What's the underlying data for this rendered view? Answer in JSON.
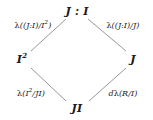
{
  "diagram": {
    "type": "hasse-diamond-lattice",
    "background_color": "#ffffff",
    "line_color": "#8c8c8c",
    "text_color": "#1a1a1a",
    "nodes": {
      "top": {
        "text": "J : I",
        "base": "J : I",
        "x": 77,
        "y": 11
      },
      "left": {
        "text": "I2",
        "base": "I",
        "exponent": "2",
        "x": 22,
        "y": 59
      },
      "right": {
        "text": "J",
        "base": "J",
        "x": 133,
        "y": 59
      },
      "bottom": {
        "text": "JI",
        "base": "JI",
        "x": 77,
        "y": 108
      }
    },
    "edge_labels": {
      "top_left": {
        "lambda": "λ",
        "argument": "((J:I)/I2)",
        "prefix": "((J:I)/I",
        "exponent": "2",
        "suffix": ")",
        "x": 33,
        "y": 25
      },
      "top_right": {
        "lambda": "λ",
        "argument": "((J:I)/J)",
        "prefix": "((J:I)/J)",
        "exponent": "",
        "suffix": "",
        "x": 123,
        "y": 25
      },
      "bottom_left": {
        "lambda": "λ",
        "argument": "(I2/JI)",
        "prefix": "(I",
        "exponent": "2",
        "suffix": "/JI)",
        "x": 31,
        "y": 93
      },
      "bottom_right": {
        "d_prefix": "d",
        "lambda": "λ",
        "argument": "(R/I)",
        "prefix": "(R/I)",
        "exponent": "",
        "suffix": "",
        "x": 123,
        "y": 93
      }
    },
    "edges": [
      {
        "from": "left",
        "to": "top",
        "x1": 31,
        "y1": 51,
        "x2": 66,
        "y2": 19
      },
      {
        "from": "top",
        "to": "right",
        "x1": 88,
        "y1": 19,
        "x2": 126,
        "y2": 51
      },
      {
        "from": "bottom",
        "to": "left",
        "x1": 66,
        "y1": 101,
        "x2": 31,
        "y2": 68
      },
      {
        "from": "right",
        "to": "bottom",
        "x1": 126,
        "y1": 68,
        "x2": 89,
        "y2": 101
      }
    ]
  }
}
